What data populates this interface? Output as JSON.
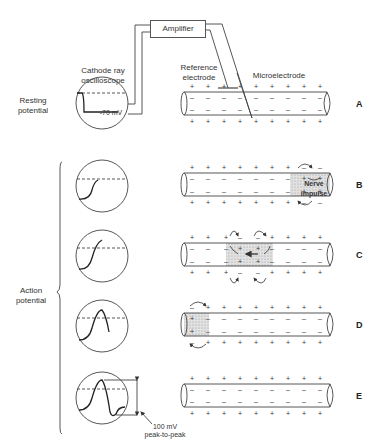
{
  "figure": {
    "amplifier_label": "Amplifier",
    "oscilloscope_label_line1": "Cathode ray",
    "oscilloscope_label_line2": "oscilloscope",
    "reference_electrode_line1": "Reference",
    "reference_electrode_line2": "electrode",
    "microelectrode_label": "Microelectrode",
    "resting_label_line1": "Resting",
    "resting_label_line2": "potential",
    "action_label_line1": "Action",
    "action_label_line2": "potential",
    "resting_value": "-70 mV",
    "amplitude_line1": "100 mV",
    "amplitude_line2": "peak-to-peak",
    "nerve_impulse_label": "Nerve impulse"
  },
  "rows": [
    {
      "letter": "A",
      "state": "resting"
    },
    {
      "letter": "B",
      "state": "impulse-entering-right"
    },
    {
      "letter": "C",
      "state": "impulse-middle"
    },
    {
      "letter": "D",
      "state": "impulse-leaving-left"
    },
    {
      "letter": "E",
      "state": "repolarized"
    }
  ],
  "colors": {
    "line": "#333333",
    "impulse_fill": "#d6d6d6",
    "background": "#ffffff"
  }
}
